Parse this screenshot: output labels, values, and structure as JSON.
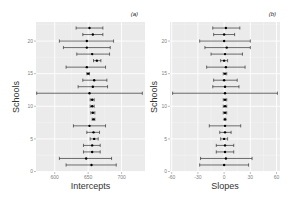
{
  "chart_data": [
    {
      "type": "scatter",
      "subtype": "forest-plot-errorbars",
      "panel_tag": "(a)",
      "title": "",
      "xlabel": "Intercepts",
      "ylabel": "Schools",
      "xlim": [
        572,
        735
      ],
      "ylim": [
        0,
        23
      ],
      "x_ticks": [
        600,
        650,
        700
      ],
      "x_tick_labels": [
        "600",
        "650",
        "700"
      ],
      "y_ticks": [
        0,
        5,
        10,
        15,
        20
      ],
      "y_tick_labels": [
        "0",
        "5",
        "10",
        "15",
        "20"
      ],
      "grid": true,
      "legend": null,
      "points": [
        {
          "school": 1,
          "estimate": 655,
          "lower": 617,
          "upper": 692
        },
        {
          "school": 2,
          "estimate": 647,
          "lower": 607,
          "upper": 685
        },
        {
          "school": 3,
          "estimate": 656,
          "lower": 643,
          "upper": 668
        },
        {
          "school": 4,
          "estimate": 656,
          "lower": 643,
          "upper": 668
        },
        {
          "school": 5,
          "estimate": 659,
          "lower": 653,
          "upper": 665
        },
        {
          "school": 6,
          "estimate": 658,
          "lower": 648,
          "upper": 667
        },
        {
          "school": 7,
          "estimate": 652,
          "lower": 628,
          "upper": 676
        },
        {
          "school": 8,
          "estimate": 658,
          "lower": 656,
          "upper": 660
        },
        {
          "school": 9,
          "estimate": 657,
          "lower": 654,
          "upper": 660
        },
        {
          "school": 10,
          "estimate": 656,
          "lower": 653,
          "upper": 659
        },
        {
          "school": 11,
          "estimate": 656,
          "lower": 653,
          "upper": 659
        },
        {
          "school": 12,
          "estimate": 652,
          "lower": 573,
          "upper": 731
        },
        {
          "school": 13,
          "estimate": 657,
          "lower": 635,
          "upper": 679
        },
        {
          "school": 14,
          "estimate": 659,
          "lower": 642,
          "upper": 678
        },
        {
          "school": 15,
          "estimate": 650,
          "lower": 648,
          "upper": 652
        },
        {
          "school": 16,
          "estimate": 648,
          "lower": 617,
          "upper": 676
        },
        {
          "school": 17,
          "estimate": 663,
          "lower": 658,
          "upper": 669
        },
        {
          "school": 18,
          "estimate": 656,
          "lower": 633,
          "upper": 682
        },
        {
          "school": 19,
          "estimate": 648,
          "lower": 613,
          "upper": 683
        },
        {
          "school": 20,
          "estimate": 648,
          "lower": 607,
          "upper": 688
        },
        {
          "school": 21,
          "estimate": 657,
          "lower": 642,
          "upper": 672
        },
        {
          "school": 22,
          "estimate": 652,
          "lower": 632,
          "upper": 672
        }
      ]
    },
    {
      "type": "scatter",
      "subtype": "forest-plot-errorbars",
      "panel_tag": "(b)",
      "title": "",
      "xlabel": "Slopes",
      "ylabel": "Schools",
      "xlim": [
        -62,
        64
      ],
      "ylim": [
        0,
        23
      ],
      "x_ticks": [
        -60,
        -30,
        0,
        30,
        60
      ],
      "x_tick_labels": [
        "-60",
        "-30",
        "0",
        "30",
        "60"
      ],
      "y_ticks": [
        0,
        5,
        10,
        15,
        20
      ],
      "y_tick_labels": [
        "0",
        "5",
        "10",
        "15",
        "20"
      ],
      "grid": true,
      "legend": null,
      "points": [
        {
          "school": 1,
          "estimate": 0,
          "lower": -28,
          "upper": 28
        },
        {
          "school": 2,
          "estimate": 2,
          "lower": -27,
          "upper": 32
        },
        {
          "school": 3,
          "estimate": 1,
          "lower": -9,
          "upper": 11
        },
        {
          "school": 4,
          "estimate": 1,
          "lower": -9,
          "upper": 11
        },
        {
          "school": 5,
          "estimate": 0,
          "lower": -4,
          "upper": 4
        },
        {
          "school": 6,
          "estimate": 1,
          "lower": -5,
          "upper": 8
        },
        {
          "school": 7,
          "estimate": 1,
          "lower": -17,
          "upper": 19
        },
        {
          "school": 8,
          "estimate": 1,
          "lower": 0,
          "upper": 2
        },
        {
          "school": 9,
          "estimate": 1,
          "lower": -1,
          "upper": 3
        },
        {
          "school": 10,
          "estimate": 1,
          "lower": -1,
          "upper": 3
        },
        {
          "school": 11,
          "estimate": 1,
          "lower": -1,
          "upper": 3
        },
        {
          "school": 12,
          "estimate": 1,
          "lower": -59,
          "upper": 61
        },
        {
          "school": 13,
          "estimate": 1,
          "lower": -13,
          "upper": 17
        },
        {
          "school": 14,
          "estimate": 0,
          "lower": -12,
          "upper": 15
        },
        {
          "school": 15,
          "estimate": 1,
          "lower": -1,
          "upper": 3
        },
        {
          "school": 16,
          "estimate": 2,
          "lower": -20,
          "upper": 24
        },
        {
          "school": 17,
          "estimate": 0,
          "lower": -4,
          "upper": 4
        },
        {
          "school": 18,
          "estimate": 1,
          "lower": -15,
          "upper": 21
        },
        {
          "school": 19,
          "estimate": 3,
          "lower": -22,
          "upper": 30
        },
        {
          "school": 20,
          "estimate": 0,
          "lower": -28,
          "upper": 30
        },
        {
          "school": 21,
          "estimate": 0,
          "lower": -12,
          "upper": 12
        },
        {
          "school": 22,
          "estimate": 2,
          "lower": -13,
          "upper": 18
        }
      ]
    }
  ],
  "style": {
    "panel_background": "#ebebeb",
    "grid_major": "#ffffff",
    "grid_minor": "#f5f5f5",
    "errorbar_color": "#333333",
    "point_color": "#000000"
  }
}
